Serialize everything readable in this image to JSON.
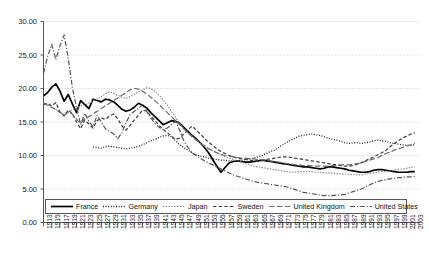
{
  "chart_data": {
    "type": "line",
    "title": "",
    "xlabel": "",
    "ylabel": "",
    "xlim": [
      1913,
      2004
    ],
    "ylim": [
      0,
      30
    ],
    "grid": true,
    "grid_style": "dotted-horizontal",
    "legend_position": "bottom",
    "ytick_labels": [
      "0.00",
      "5.00",
      "10.00",
      "15.00",
      "20.00",
      "25.00",
      "30.00"
    ],
    "ytick_values": [
      0,
      5,
      10,
      15,
      20,
      25,
      30
    ],
    "xtick_labels": [
      "1913",
      "1915",
      "1917",
      "1919",
      "1921",
      "1923",
      "1925",
      "1927",
      "1929",
      "1931",
      "1933",
      "1935",
      "1937",
      "1939",
      "1941",
      "1943",
      "1945",
      "1947",
      "1949",
      "1951",
      "1953",
      "1955",
      "1957",
      "1959",
      "1961",
      "1963",
      "1965",
      "1967",
      "1969",
      "1971",
      "1973",
      "1975",
      "1977",
      "1979",
      "1981",
      "1983",
      "1985",
      "1987",
      "1989",
      "1991",
      "1993",
      "1995",
      "1997",
      "1999",
      "2001",
      "2003"
    ],
    "series": [
      {
        "name": "France",
        "style": "solid",
        "color": "#000000",
        "width": 1.7,
        "x": [
          1913,
          1914,
          1915,
          1916,
          1917,
          1918,
          1919,
          1920,
          1921,
          1922,
          1923,
          1924,
          1925,
          1926,
          1927,
          1928,
          1929,
          1930,
          1931,
          1932,
          1933,
          1934,
          1935,
          1936,
          1937,
          1938,
          1939,
          1940,
          1941,
          1942,
          1943,
          1944,
          1945,
          1946,
          1947,
          1948,
          1949,
          1950,
          1951,
          1952,
          1953,
          1954,
          1955,
          1956,
          1957,
          1958,
          1959,
          1960,
          1961,
          1962,
          1963,
          1964,
          1965,
          1966,
          1967,
          1968,
          1969,
          1970,
          1971,
          1972,
          1973,
          1974,
          1975,
          1976,
          1977,
          1978,
          1979,
          1980,
          1981,
          1982,
          1983,
          1984,
          1985,
          1986,
          1987,
          1988,
          1989,
          1990,
          1991,
          1992,
          1993,
          1994,
          1995,
          1996,
          1997,
          1998,
          1999,
          2000,
          2001,
          2002,
          2003
        ],
        "y": [
          18.9,
          19.4,
          20.2,
          20.7,
          19.6,
          18.1,
          19.1,
          17.7,
          16.4,
          18.2,
          17.6,
          17.0,
          18.4,
          18.2,
          18.0,
          18.4,
          18.3,
          18.0,
          17.5,
          16.9,
          16.6,
          16.8,
          17.2,
          17.8,
          17.5,
          17.1,
          16.4,
          15.8,
          15.2,
          14.6,
          14.9,
          15.2,
          15.1,
          14.8,
          14.2,
          13.6,
          13.0,
          12.5,
          11.9,
          11.2,
          10.4,
          9.4,
          8.4,
          7.5,
          8.2,
          8.9,
          9.1,
          9.2,
          9.1,
          9.0,
          9.0,
          9.1,
          9.2,
          9.3,
          9.2,
          9.1,
          9.0,
          8.9,
          8.8,
          8.7,
          8.6,
          8.5,
          8.4,
          8.3,
          8.3,
          8.2,
          8.1,
          8.0,
          8.1,
          8.3,
          8.3,
          8.2,
          8.1,
          8.0,
          7.8,
          7.7,
          7.6,
          7.5,
          7.5,
          7.6,
          7.8,
          7.9,
          7.9,
          7.8,
          7.7,
          7.6,
          7.5,
          7.5,
          7.5,
          7.6,
          7.6
        ]
      },
      {
        "name": "Germany",
        "style": "dotted",
        "color": "#222222",
        "width": 1.3,
        "x": [
          1925,
          1926,
          1927,
          1928,
          1929,
          1930,
          1931,
          1932,
          1933,
          1934,
          1935,
          1936,
          1937,
          1938,
          1939,
          1940,
          1941,
          1942,
          1943,
          1944,
          1945,
          1946,
          1947,
          1948,
          1949,
          1950,
          1951,
          1952,
          1953,
          1954,
          1955,
          1956,
          1957,
          1958,
          1959,
          1960,
          1961,
          1962,
          1963,
          1964,
          1965,
          1966,
          1967,
          1968,
          1969,
          1970,
          1971,
          1972,
          1973,
          1974,
          1975,
          1976,
          1977,
          1978,
          1979,
          1980,
          1981,
          1982,
          1983,
          1984,
          1985,
          1986,
          1987,
          1988,
          1989,
          1990,
          1991,
          1992,
          1993,
          1994,
          1995,
          1996,
          1997,
          1998,
          1999,
          2000,
          2001,
          2002,
          2003
        ],
        "y": [
          11.3,
          11.2,
          11.1,
          11.3,
          11.4,
          11.3,
          11.2,
          11.1,
          11.0,
          11.1,
          11.2,
          11.4,
          11.6,
          11.9,
          12.2,
          12.4,
          12.7,
          12.9,
          13.0,
          12.8,
          12.2,
          11.6,
          11.2,
          10.8,
          10.4,
          10.1,
          9.9,
          9.8,
          9.6,
          9.5,
          9.4,
          9.3,
          9.3,
          9.2,
          9.2,
          9.2,
          9.3,
          9.4,
          9.5,
          9.6,
          9.8,
          10.0,
          10.3,
          10.6,
          10.8,
          11.2,
          11.6,
          12.0,
          12.3,
          12.6,
          12.9,
          13.0,
          13.1,
          13.2,
          13.1,
          13.0,
          12.8,
          12.6,
          12.4,
          12.3,
          12.1,
          11.9,
          11.8,
          11.9,
          11.9,
          11.8,
          11.9,
          12.0,
          12.2,
          12.3,
          12.2,
          12.1,
          11.9,
          11.8,
          11.7,
          11.6,
          11.5,
          11.5,
          11.6
        ]
      },
      {
        "name": "Japan",
        "style": "dash-fine",
        "color": "#888888",
        "width": 1.2,
        "x": [
          1913,
          1914,
          1915,
          1916,
          1917,
          1918,
          1919,
          1920,
          1921,
          1922,
          1923,
          1924,
          1925,
          1926,
          1927,
          1928,
          1929,
          1930,
          1931,
          1932,
          1933,
          1934,
          1935,
          1936,
          1937,
          1938,
          1939,
          1940,
          1941,
          1942,
          1943,
          1944,
          1945,
          1946,
          1947,
          1948,
          1949,
          1950,
          1951,
          1952,
          1953,
          1954,
          1955,
          1956,
          1957,
          1958,
          1959,
          1960,
          1961,
          1962,
          1963,
          1964,
          1965,
          1966,
          1967,
          1968,
          1969,
          1970,
          1971,
          1972,
          1973,
          1974,
          1975,
          1976,
          1977,
          1978,
          1979,
          1980,
          1981,
          1982,
          1983,
          1984,
          1985,
          1986,
          1987,
          1988,
          1989,
          1990,
          1991,
          1992,
          1993,
          1994,
          1995,
          1996,
          1997,
          1998,
          1999,
          2000,
          2001,
          2002,
          2003
        ],
        "y": [
          17.9,
          17.6,
          17.2,
          16.9,
          16.5,
          16.2,
          16.5,
          16.8,
          17.1,
          17.4,
          17.5,
          17.8,
          18.1,
          18.4,
          18.8,
          19.2,
          19.5,
          19.3,
          19.0,
          18.7,
          18.5,
          18.8,
          19.1,
          19.5,
          19.8,
          20.1,
          20.0,
          19.6,
          19.0,
          18.3,
          17.5,
          16.6,
          15.7,
          14.8,
          14.0,
          13.4,
          12.9,
          12.4,
          11.9,
          11.5,
          11.1,
          10.7,
          10.4,
          10.1,
          9.8,
          9.6,
          9.4,
          9.2,
          9.0,
          8.8,
          8.6,
          8.4,
          8.3,
          8.2,
          8.1,
          8.0,
          7.9,
          7.8,
          7.7,
          7.6,
          7.5,
          7.5,
          7.6,
          7.6,
          7.6,
          7.6,
          7.5,
          7.5,
          7.4,
          7.4,
          7.4,
          7.3,
          7.3,
          7.2,
          7.2,
          7.2,
          7.1,
          7.1,
          7.2,
          7.3,
          7.4,
          7.5,
          7.6,
          7.6,
          7.7,
          7.8,
          7.9,
          8.0,
          8.1,
          8.2,
          8.3
        ]
      },
      {
        "name": "Sweden",
        "style": "dashed",
        "color": "#3a3a3a",
        "width": 1.2,
        "x": [
          1913,
          1914,
          1915,
          1916,
          1917,
          1918,
          1919,
          1920,
          1921,
          1922,
          1923,
          1924,
          1925,
          1926,
          1927,
          1928,
          1929,
          1930,
          1931,
          1932,
          1933,
          1934,
          1935,
          1936,
          1937,
          1938,
          1939,
          1940,
          1941,
          1942,
          1943,
          1944,
          1945,
          1946,
          1947,
          1948,
          1949,
          1950,
          1951,
          1952,
          1953,
          1954,
          1955,
          1956,
          1957,
          1958,
          1959,
          1960,
          1961,
          1962,
          1963,
          1964,
          1965,
          1966,
          1967,
          1968,
          1969,
          1970,
          1971,
          1972,
          1973,
          1974,
          1975,
          1976,
          1977,
          1978,
          1979,
          1980,
          1981,
          1982,
          1983,
          1984,
          1985,
          1986,
          1987,
          1988,
          1989,
          1990,
          1991,
          1992,
          1993,
          1994,
          1995,
          1996,
          1997,
          1998,
          1999,
          2000,
          2001,
          2002,
          2003
        ],
        "y": [
          17.6,
          17.8,
          17.4,
          17.9,
          16.5,
          15.9,
          16.8,
          16.2,
          15.0,
          14.0,
          15.3,
          14.7,
          14.1,
          15.2,
          15.6,
          15.4,
          15.9,
          16.2,
          15.5,
          14.4,
          13.8,
          14.5,
          15.3,
          16.0,
          16.8,
          16.6,
          15.9,
          15.2,
          14.5,
          13.9,
          13.4,
          12.9,
          12.4,
          12.6,
          13.2,
          13.8,
          14.4,
          13.8,
          13.2,
          12.6,
          12.0,
          11.5,
          11.0,
          10.6,
          10.3,
          10.0,
          9.8,
          9.6,
          9.5,
          9.4,
          9.3,
          9.2,
          9.2,
          9.3,
          9.4,
          9.5,
          9.6,
          9.7,
          9.8,
          9.8,
          9.7,
          9.6,
          9.5,
          9.4,
          9.3,
          9.2,
          9.1,
          9.0,
          8.9,
          8.8,
          8.7,
          8.6,
          8.5,
          8.4,
          8.4,
          8.5,
          8.7,
          8.9,
          9.2,
          9.5,
          9.8,
          10.1,
          10.4,
          10.8,
          11.3,
          11.8,
          12.2,
          12.6,
          12.9,
          13.2,
          13.4
        ]
      },
      {
        "name": "United Kingdom",
        "style": "longdash",
        "color": "#6a6a6a",
        "width": 1.2,
        "x": [
          1913,
          1914,
          1915,
          1916,
          1917,
          1918,
          1919,
          1920,
          1921,
          1922,
          1923,
          1924,
          1925,
          1926,
          1927,
          1928,
          1929,
          1930,
          1931,
          1932,
          1933,
          1934,
          1935,
          1936,
          1937,
          1938,
          1939,
          1940,
          1941,
          1942,
          1943,
          1944,
          1945,
          1946,
          1947,
          1948,
          1949,
          1950,
          1951,
          1952,
          1953,
          1954,
          1955,
          1956,
          1957,
          1958,
          1959,
          1960,
          1961,
          1962,
          1963,
          1964,
          1965,
          1966,
          1967,
          1968,
          1969,
          1970,
          1971,
          1972,
          1973,
          1974,
          1975,
          1976,
          1977,
          1978,
          1979,
          1980,
          1981,
          1982,
          1983,
          1984,
          1985,
          1986,
          1987,
          1988,
          1989,
          1990,
          1991,
          1992,
          1993,
          1994,
          1995,
          1996,
          1997,
          1998,
          1999,
          2000,
          2001,
          2002,
          2003
        ],
        "y": [
          17.8,
          17.5,
          17.2,
          16.8,
          16.4,
          16.0,
          16.5,
          16.2,
          15.4,
          14.8,
          15.5,
          15.8,
          16.2,
          16.6,
          17.0,
          17.4,
          17.8,
          18.2,
          18.6,
          19.0,
          19.4,
          19.8,
          20.0,
          19.9,
          19.6,
          19.2,
          18.7,
          18.2,
          17.6,
          17.0,
          16.4,
          15.8,
          15.2,
          14.6,
          14.0,
          13.4,
          12.8,
          12.3,
          11.8,
          11.4,
          11.0,
          10.7,
          10.4,
          10.2,
          10.0,
          9.9,
          9.8,
          9.7,
          9.6,
          9.6,
          9.5,
          9.5,
          9.4,
          9.4,
          9.3,
          9.2,
          9.1,
          9.0,
          8.9,
          8.8,
          8.7,
          8.6,
          8.6,
          8.5,
          8.5,
          8.5,
          8.4,
          8.4,
          8.4,
          8.4,
          8.5,
          8.5,
          8.6,
          8.6,
          8.6,
          8.7,
          8.8,
          8.9,
          9.1,
          9.3,
          9.5,
          9.7,
          10.0,
          10.3,
          10.5,
          10.8,
          11.0,
          11.2,
          11.4,
          11.6,
          11.8
        ]
      },
      {
        "name": "United States",
        "style": "dashdot",
        "color": "#555555",
        "width": 1.2,
        "x": [
          1913,
          1914,
          1915,
          1916,
          1917,
          1918,
          1919,
          1920,
          1921,
          1922,
          1923,
          1924,
          1925,
          1926,
          1927,
          1928,
          1929,
          1930,
          1931,
          1932,
          1933,
          1934,
          1935,
          1936,
          1937,
          1938,
          1939,
          1940,
          1941,
          1942,
          1943,
          1944,
          1945,
          1946,
          1947,
          1948,
          1949,
          1950,
          1951,
          1952,
          1953,
          1954,
          1955,
          1956,
          1957,
          1958,
          1959,
          1960,
          1961,
          1962,
          1963,
          1964,
          1965,
          1966,
          1967,
          1968,
          1969,
          1970,
          1971,
          1972,
          1973,
          1974,
          1975,
          1976,
          1977,
          1978,
          1979,
          1980,
          1981,
          1982,
          1983,
          1984,
          1985,
          1986,
          1987,
          1988,
          1989,
          1990,
          1991,
          1992,
          1993,
          1994,
          1995,
          1996,
          1997,
          1998,
          1999,
          2000,
          2001,
          2002,
          2003
        ],
        "y": [
          22.3,
          24.8,
          26.6,
          24.3,
          26.4,
          28.0,
          24.5,
          20.1,
          17.2,
          14.6,
          16.3,
          15.1,
          14.3,
          16.0,
          15.0,
          14.0,
          13.6,
          13.2,
          12.5,
          13.4,
          14.9,
          16.1,
          16.6,
          17.0,
          17.6,
          16.6,
          15.6,
          14.8,
          14.2,
          13.9,
          14.1,
          14.6,
          15.1,
          13.8,
          12.2,
          11.2,
          10.4,
          10.0,
          9.6,
          9.2,
          8.9,
          8.6,
          8.3,
          8.0,
          7.7,
          7.4,
          7.1,
          6.9,
          6.7,
          6.5,
          6.3,
          6.1,
          6.0,
          5.9,
          5.8,
          5.7,
          5.6,
          5.5,
          5.4,
          5.3,
          5.1,
          4.9,
          4.7,
          4.5,
          4.4,
          4.3,
          4.2,
          4.1,
          4.0,
          4.0,
          4.0,
          4.1,
          4.1,
          4.2,
          4.4,
          4.6,
          4.8,
          5.0,
          5.3,
          5.6,
          5.9,
          6.1,
          6.3,
          6.4,
          6.5,
          6.6,
          6.7,
          6.7,
          6.8,
          6.8,
          6.9
        ]
      }
    ]
  },
  "legend": {
    "items": [
      {
        "label": "France"
      },
      {
        "label": "Germany"
      },
      {
        "label": "Japan"
      },
      {
        "label": "Sweden"
      },
      {
        "label": "United Kingdom"
      },
      {
        "label": "United States"
      }
    ]
  }
}
